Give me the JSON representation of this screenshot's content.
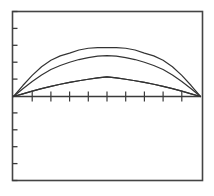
{
  "figure": {
    "background_color": "#ffffff",
    "line_color": "#333333",
    "frame_color": "#444444",
    "axis_color": "#3a3a3a"
  },
  "chart_data": {
    "type": "line",
    "title": "",
    "subtitle": "",
    "xlabel": "",
    "ylabel": "",
    "grid": false,
    "legend": "none",
    "xlim": [
      0,
      1
    ],
    "ylim": [
      -1,
      1
    ],
    "x_tick_count": 9,
    "y_tick_count": 11,
    "x_tick_labels": [],
    "y_tick_labels": [],
    "x": [
      0,
      0.05,
      0.1,
      0.15,
      0.2,
      0.25,
      0.3,
      0.35,
      0.4,
      0.45,
      0.5,
      0.55,
      0.6,
      0.65,
      0.7,
      0.75,
      0.8,
      0.85,
      0.9,
      0.95,
      1
    ],
    "series": [
      {
        "name": "curve-1",
        "amplitude": 0.72,
        "values": [
          0,
          0.224,
          0.431,
          0.608,
          0.74,
          0.83,
          0.886,
          0.95,
          0.985,
          0.999,
          1,
          0.999,
          0.985,
          0.95,
          0.886,
          0.83,
          0.74,
          0.608,
          0.431,
          0.224,
          0
        ]
      },
      {
        "name": "curve-2",
        "amplitude": 0.6,
        "values": [
          0,
          0.188,
          0.368,
          0.529,
          0.66,
          0.76,
          0.84,
          0.906,
          0.955,
          0.988,
          1,
          0.988,
          0.955,
          0.906,
          0.84,
          0.76,
          0.66,
          0.529,
          0.368,
          0.188,
          0
        ]
      },
      {
        "name": "curve-3",
        "amplitude": 0.29,
        "values": [
          0,
          0.137,
          0.27,
          0.396,
          0.51,
          0.62,
          0.715,
          0.8,
          0.875,
          0.94,
          1,
          0.94,
          0.875,
          0.8,
          0.715,
          0.62,
          0.51,
          0.396,
          0.27,
          0.137,
          0
        ]
      },
      {
        "name": "curve-4",
        "amplitude": -0.29,
        "values": [
          0,
          -0.137,
          -0.27,
          -0.396,
          -0.51,
          -0.62,
          -0.715,
          -0.8,
          -0.875,
          -0.94,
          -1,
          -0.94,
          -0.875,
          -0.8,
          -0.715,
          -0.62,
          -0.51,
          -0.396,
          -0.27,
          -0.137,
          0
        ]
      }
    ]
  }
}
